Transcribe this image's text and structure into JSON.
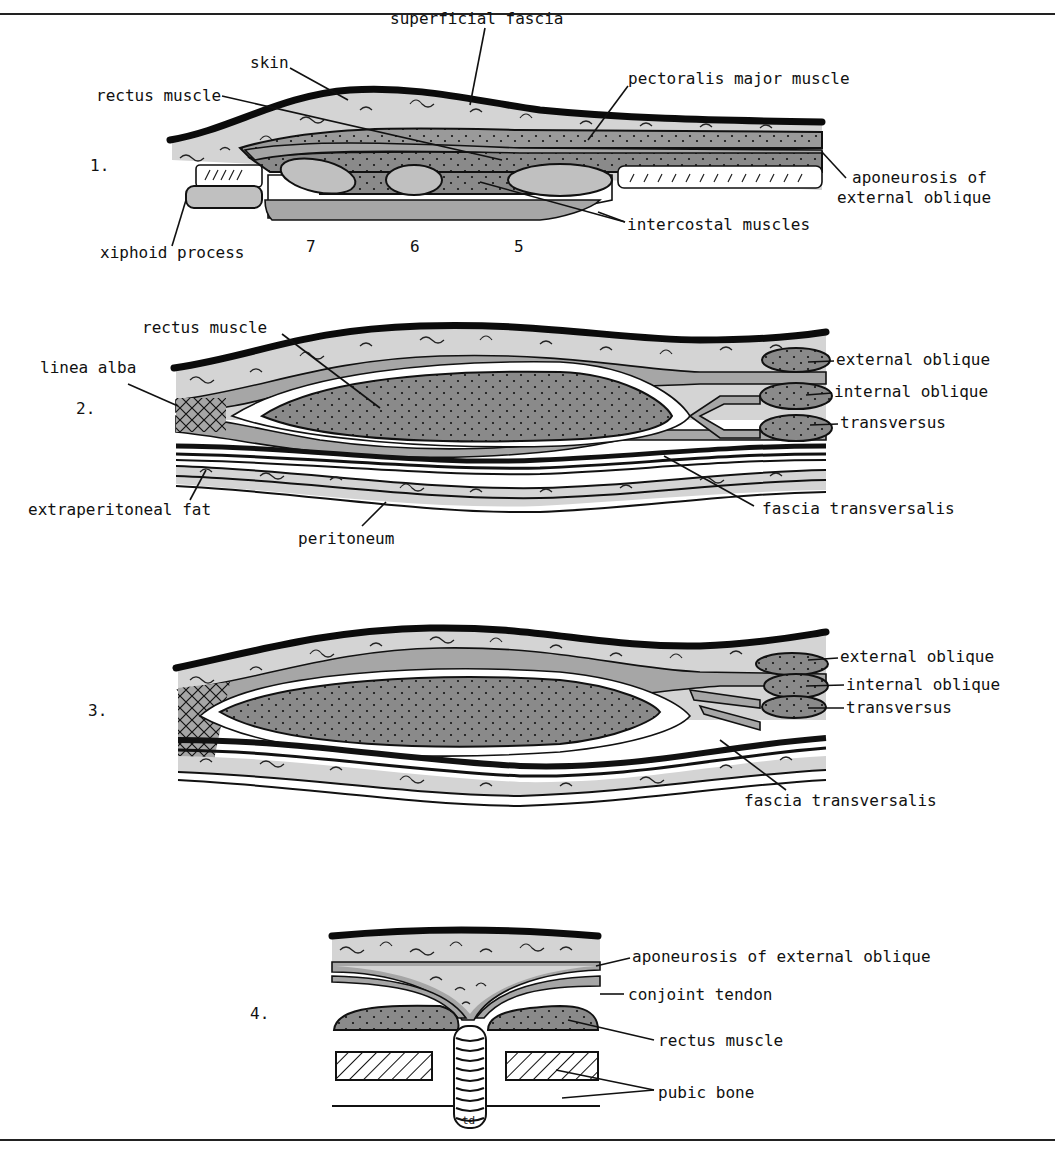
{
  "figure": {
    "panels": [
      {
        "number": "1.",
        "labels": {
          "skin": "skin",
          "superficial_fascia": "superficial fascia",
          "rectus_muscle": "rectus muscle",
          "pectoralis_major": "pectoralis major muscle",
          "aponeurosis_line1": "aponeurosis of",
          "aponeurosis_line2": "external oblique",
          "intercostal": "intercostal muscles",
          "xiphoid": "xiphoid process"
        },
        "rib_numbers": [
          "7",
          "6",
          "5"
        ]
      },
      {
        "number": "2.",
        "labels": {
          "rectus_muscle": "rectus muscle",
          "linea_alba": "linea alba",
          "external_oblique": "external oblique",
          "internal_oblique": "internal oblique",
          "transversus": "transversus",
          "extraperitoneal_fat": "extraperitoneal fat",
          "fascia_transversalis": "fascia transversalis",
          "peritoneum": "peritoneum"
        }
      },
      {
        "number": "3.",
        "labels": {
          "external_oblique": "external oblique",
          "internal_oblique": "internal oblique",
          "transversus": "transversus",
          "fascia_transversalis": "fascia transversalis"
        }
      },
      {
        "number": "4.",
        "labels": {
          "aponeurosis": "aponeurosis of external oblique",
          "conjoint_tendon": "conjoint tendon",
          "rectus_muscle": "rectus muscle",
          "pubic_bone": "pubic bone"
        },
        "signature": "td"
      }
    ]
  }
}
